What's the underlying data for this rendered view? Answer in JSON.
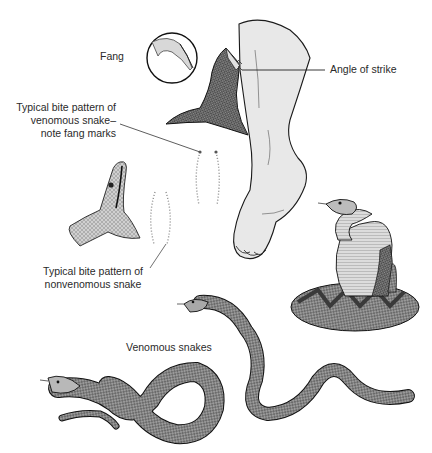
{
  "figure": {
    "type": "medical-illustration",
    "labels": {
      "fang": "Fang",
      "angle_of_strike": "Angle of strike",
      "venomous_bite_line1": "Typical bite pattern of",
      "venomous_bite_line2": "venomous snake–",
      "venomous_bite_line3": "note fang marks",
      "nonvenomous_bite_line1": "Typical bite pattern of",
      "nonvenomous_bite_line2": "nonvenomous snake",
      "venomous_snakes": "Venomous snakes"
    },
    "elements": [
      "fang-detail-circle",
      "venomous-snake-head-striking",
      "foot-and-leg",
      "venomous-bite-pattern",
      "nonvenomous-snake-head",
      "nonvenomous-bite-pattern",
      "coiled-rattlesnake",
      "venomous-snake-figure-eight",
      "venomous-snake-slithering"
    ],
    "colors": {
      "line": "#1a1a1a",
      "skin": "#e6e6e6",
      "snake_dark": "#5a5a5a",
      "snake_mid": "#8c8c8c",
      "snake_light": "#c8c8c8",
      "text": "#2a2a2a",
      "dots": "#8a8a8a"
    }
  }
}
